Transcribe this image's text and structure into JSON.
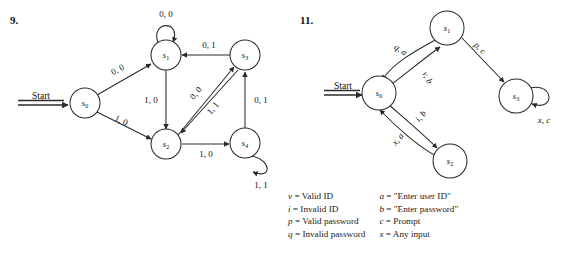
{
  "figures": [
    {
      "number": "9.",
      "start_label": "Start",
      "states": [
        {
          "id": "s0",
          "base": "s",
          "sub": "0"
        },
        {
          "id": "s1",
          "base": "s",
          "sub": "1"
        },
        {
          "id": "s2",
          "base": "s",
          "sub": "2"
        },
        {
          "id": "s3",
          "base": "s",
          "sub": "3"
        },
        {
          "id": "s4",
          "base": "s",
          "sub": "4"
        }
      ],
      "transitions": [
        {
          "from": "s1",
          "to": "s1",
          "label": "0, 0"
        },
        {
          "from": "s0",
          "to": "s1",
          "label": "0, 0"
        },
        {
          "from": "s0",
          "to": "s2",
          "label": "1, 0"
        },
        {
          "from": "s3",
          "to": "s1",
          "label": "0, 1"
        },
        {
          "from": "s1",
          "to": "s2",
          "label": "1, 0"
        },
        {
          "from": "s2",
          "to": "s3",
          "label": "0, 0"
        },
        {
          "from": "s3",
          "to": "s2",
          "label": "1, 1"
        },
        {
          "from": "s2",
          "to": "s4",
          "label": "1, 0"
        },
        {
          "from": "s4",
          "to": "s3",
          "label": "0, 1"
        },
        {
          "from": "s4",
          "to": "s4",
          "label": "1, 1"
        }
      ]
    },
    {
      "number": "11.",
      "start_label": "Start",
      "states": [
        {
          "id": "s0",
          "base": "s",
          "sub": "0"
        },
        {
          "id": "s1",
          "base": "s",
          "sub": "1"
        },
        {
          "id": "s2",
          "base": "s",
          "sub": "2"
        },
        {
          "id": "s3",
          "base": "s",
          "sub": "3"
        }
      ],
      "transitions": [
        {
          "from": "s1",
          "to": "s0",
          "label": "q, a"
        },
        {
          "from": "s0",
          "to": "s1",
          "label": "v, b"
        },
        {
          "from": "s1",
          "to": "s3",
          "label": "p, c"
        },
        {
          "from": "s0",
          "to": "s2",
          "label": "i, b"
        },
        {
          "from": "s2",
          "to": "s0",
          "label": "x, a"
        },
        {
          "from": "s3",
          "to": "s3",
          "label": "x, c"
        }
      ]
    }
  ],
  "legend": {
    "left_column": [
      {
        "symbol": "v",
        "equals": "=",
        "text": "Valid ID"
      },
      {
        "symbol": "i",
        "equals": "=",
        "text": "Invalid ID"
      },
      {
        "symbol": "p",
        "equals": "=",
        "text": "Valid password"
      },
      {
        "symbol": "q",
        "equals": "=",
        "text": "Invalid  password"
      }
    ],
    "right_column": [
      {
        "symbol": "a",
        "equals": "=",
        "text": "\"Enter user ID\""
      },
      {
        "symbol": "b",
        "equals": "=",
        "text": "\"Enter password\""
      },
      {
        "symbol": "c",
        "equals": "=",
        "text": "Prompt"
      },
      {
        "symbol": "x",
        "equals": "=",
        "text": "Any input"
      }
    ]
  },
  "colors": {
    "ink": "#2a2a2a",
    "background": "#ffffff"
  }
}
